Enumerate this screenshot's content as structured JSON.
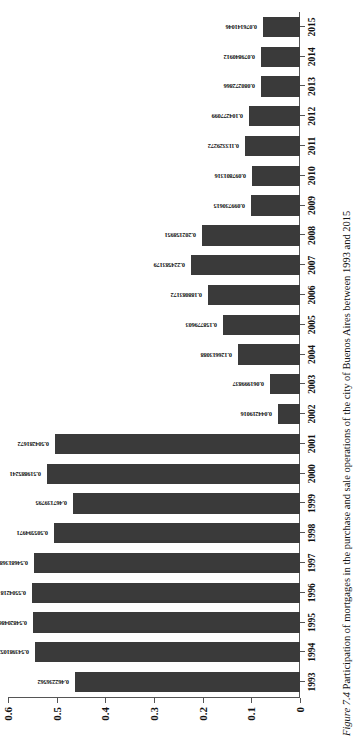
{
  "figure": {
    "caption_label": "Figure 7.4",
    "caption_text": "Participation of mortgages in the purchase and sale operations of the city of Buenos Aires between 1993 and 2015"
  },
  "chart_data": {
    "type": "bar",
    "title": "",
    "xlabel": "",
    "ylabel": "",
    "ylim": [
      0,
      0.6
    ],
    "grid": false,
    "legend": null,
    "orientation": "vertical-bars-on-rotated-page",
    "bar_color": "#3a3a3a",
    "ytick_labels": [
      "0.6",
      "0.5",
      "0.4",
      "0.3",
      "0.2",
      "0.1",
      "0"
    ],
    "ytick_values": [
      0.6,
      0.5,
      0.4,
      0.3,
      0.2,
      0.1,
      0
    ],
    "categories": [
      "1993",
      "1994",
      "1995",
      "1996",
      "1997",
      "1998",
      "1999",
      "2000",
      "2001",
      "2002",
      "2003",
      "2004",
      "2005",
      "2006",
      "2007",
      "2008",
      "2009",
      "2010",
      "2011",
      "2012",
      "2013",
      "2014",
      "2015"
    ],
    "values": [
      0.462236562,
      0.543981052,
      0.548204864,
      0.5504218,
      0.546813687,
      0.505594971,
      0.467139795,
      0.519885241,
      0.504281672,
      0.044219016,
      0.061999837,
      0.126613088,
      0.158779603,
      0.188083172,
      0.224583179,
      0.202158951,
      0.099730615,
      0.097801316,
      0.113329272,
      0.104277099,
      0.080272866,
      0.079840912,
      0.076141046
    ],
    "data_labels": [
      "0.462236562",
      "0.543981052",
      "0.548204864",
      "0.5504218",
      "0.546813687",
      "0.505594971",
      "0.467139795",
      "0.519885241",
      "0.504281672",
      "0.044219016",
      "0.061999837",
      "0.126613088",
      "0.158779603",
      "0.188083172",
      "0.224583179",
      "0.202158951",
      "0.099730615",
      "0.097801316",
      "0.113329272",
      "0.104277099",
      "0.080272866",
      "0.079840912",
      "0.076141046"
    ]
  }
}
